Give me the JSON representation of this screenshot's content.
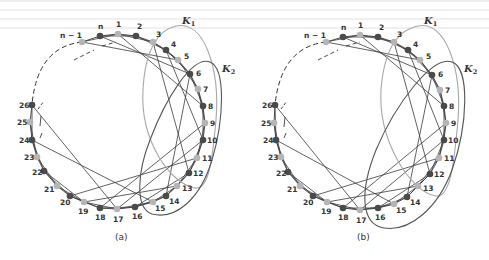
{
  "figure": {
    "colors": {
      "dark_node": "#4a4a4a",
      "light_node": "#b5b5b5",
      "edge": "#3a3a3a",
      "k1_loop": "#a8a8a8",
      "k2_loop": "#555555",
      "dashed": "#333333"
    },
    "panels": [
      {
        "id": "a",
        "caption": "(a)",
        "caption_pos": [
          115,
          240
        ],
        "nodes": [
          {
            "label": "n-1",
            "display": "n − 1",
            "x": 82,
            "y": 42,
            "tone": "light",
            "lx": -22,
            "ly": -4
          },
          {
            "label": "n",
            "display": "n",
            "x": 100,
            "y": 36,
            "tone": "dark",
            "lx": -2,
            "ly": -7
          },
          {
            "label": "1",
            "display": "1",
            "x": 118,
            "y": 34,
            "tone": "light",
            "lx": -2,
            "ly": -7
          },
          {
            "label": "2",
            "display": "2",
            "x": 136,
            "y": 36,
            "tone": "dark",
            "lx": 1,
            "ly": -7
          },
          {
            "label": "3",
            "display": "3",
            "x": 153,
            "y": 42,
            "tone": "light",
            "lx": 3,
            "ly": -5
          },
          {
            "label": "4",
            "display": "4",
            "x": 166,
            "y": 50,
            "tone": "dark",
            "lx": 5,
            "ly": -3
          },
          {
            "label": "5",
            "display": "5",
            "x": 178,
            "y": 60,
            "tone": "light",
            "lx": 6,
            "ly": -1
          },
          {
            "label": "6",
            "display": "6",
            "x": 190,
            "y": 74,
            "tone": "dark",
            "lx": 6,
            "ly": 2
          },
          {
            "label": "7",
            "display": "7",
            "x": 198,
            "y": 89,
            "tone": "light",
            "lx": 5,
            "ly": 3
          },
          {
            "label": "8",
            "display": "8",
            "x": 203,
            "y": 106,
            "tone": "dark",
            "lx": 5,
            "ly": 3
          },
          {
            "label": "9",
            "display": "9",
            "x": 205,
            "y": 123,
            "tone": "light",
            "lx": 5,
            "ly": 3
          },
          {
            "label": "10",
            "display": "10",
            "x": 203,
            "y": 140,
            "tone": "dark",
            "lx": 4,
            "ly": 3
          },
          {
            "label": "11",
            "display": "11",
            "x": 197,
            "y": 158,
            "tone": "light",
            "lx": 5,
            "ly": 3
          },
          {
            "label": "12",
            "display": "12",
            "x": 189,
            "y": 173,
            "tone": "dark",
            "lx": 4,
            "ly": 3
          },
          {
            "label": "13",
            "display": "13",
            "x": 177,
            "y": 186,
            "tone": "light",
            "lx": 5,
            "ly": 5
          },
          {
            "label": "14",
            "display": "14",
            "x": 166,
            "y": 196,
            "tone": "dark",
            "lx": 3,
            "ly": 8
          },
          {
            "label": "15",
            "display": "15",
            "x": 153,
            "y": 202,
            "tone": "light",
            "lx": 2,
            "ly": 9
          },
          {
            "label": "16",
            "display": "16",
            "x": 135,
            "y": 207,
            "tone": "dark",
            "lx": -3,
            "ly": 12
          },
          {
            "label": "17",
            "display": "17",
            "x": 117,
            "y": 209,
            "tone": "light",
            "lx": -4,
            "ly": 13
          },
          {
            "label": "18",
            "display": "18",
            "x": 100,
            "y": 208,
            "tone": "dark",
            "lx": -5,
            "ly": 12
          },
          {
            "label": "19",
            "display": "19",
            "x": 84,
            "y": 202,
            "tone": "light",
            "lx": -6,
            "ly": 12
          },
          {
            "label": "20",
            "display": "20",
            "x": 70,
            "y": 196,
            "tone": "dark",
            "lx": -10,
            "ly": 9
          },
          {
            "label": "21",
            "display": "21",
            "x": 57,
            "y": 186,
            "tone": "light",
            "lx": -13,
            "ly": 6
          },
          {
            "label": "22",
            "display": "22",
            "x": 44,
            "y": 171,
            "tone": "dark",
            "lx": -12,
            "ly": 4
          },
          {
            "label": "23",
            "display": "23",
            "x": 37,
            "y": 157,
            "tone": "light",
            "lx": -13,
            "ly": 3
          },
          {
            "label": "24",
            "display": "24",
            "x": 32,
            "y": 140,
            "tone": "dark",
            "lx": -13,
            "ly": 3
          },
          {
            "label": "25",
            "display": "25",
            "x": 30,
            "y": 122,
            "tone": "light",
            "lx": -13,
            "ly": 3
          },
          {
            "label": "26",
            "display": "26",
            "x": 32,
            "y": 105,
            "tone": "dark",
            "lx": -13,
            "ly": 3
          }
        ],
        "k1": {
          "label": "K",
          "sub": "1",
          "label_pos": [
            182,
            24
          ],
          "path": "M176,26 C205,20 220,70 216,120 C212,165 208,190 195,188 C170,184 140,140 143,90 C145,50 158,30 176,26 Z"
        },
        "k2": {
          "label": "K",
          "sub": "2",
          "label_pos": [
            222,
            72
          ],
          "path": "M210,62 C226,68 224,120 212,160 C200,200 175,220 152,214 C134,208 138,170 150,140 C165,100 192,55 210,62 Z"
        }
      },
      {
        "id": "b",
        "caption": "(b)",
        "caption_pos": [
          357,
          240
        ],
        "nodes": [
          {
            "label": "n-1",
            "display": "n − 1",
            "x": 326,
            "y": 42,
            "tone": "light",
            "lx": -22,
            "ly": -4
          },
          {
            "label": "n",
            "display": "n",
            "x": 343,
            "y": 37,
            "tone": "dark",
            "lx": -2,
            "ly": -7
          },
          {
            "label": "1",
            "display": "1",
            "x": 360,
            "y": 35,
            "tone": "light",
            "lx": -2,
            "ly": -7
          },
          {
            "label": "2",
            "display": "2",
            "x": 378,
            "y": 37,
            "tone": "dark",
            "lx": 1,
            "ly": -7
          },
          {
            "label": "3",
            "display": "3",
            "x": 394,
            "y": 42,
            "tone": "light",
            "lx": 3,
            "ly": -5
          },
          {
            "label": "4",
            "display": "4",
            "x": 408,
            "y": 50,
            "tone": "dark",
            "lx": 5,
            "ly": -3
          },
          {
            "label": "5",
            "display": "5",
            "x": 420,
            "y": 60,
            "tone": "light",
            "lx": 6,
            "ly": -1
          },
          {
            "label": "6",
            "display": "6",
            "x": 432,
            "y": 75,
            "tone": "dark",
            "lx": 6,
            "ly": 2
          },
          {
            "label": "7",
            "display": "7",
            "x": 440,
            "y": 90,
            "tone": "light",
            "lx": 5,
            "ly": 3
          },
          {
            "label": "8",
            "display": "8",
            "x": 444,
            "y": 106,
            "tone": "dark",
            "lx": 5,
            "ly": 3
          },
          {
            "label": "9",
            "display": "9",
            "x": 446,
            "y": 123,
            "tone": "light",
            "lx": 5,
            "ly": 3
          },
          {
            "label": "10",
            "display": "10",
            "x": 444,
            "y": 140,
            "tone": "dark",
            "lx": 4,
            "ly": 3
          },
          {
            "label": "11",
            "display": "11",
            "x": 439,
            "y": 158,
            "tone": "light",
            "lx": 5,
            "ly": 3
          },
          {
            "label": "12",
            "display": "12",
            "x": 430,
            "y": 174,
            "tone": "dark",
            "lx": 4,
            "ly": 3
          },
          {
            "label": "13",
            "display": "13",
            "x": 418,
            "y": 186,
            "tone": "light",
            "lx": 5,
            "ly": 5
          },
          {
            "label": "14",
            "display": "14",
            "x": 407,
            "y": 197,
            "tone": "dark",
            "lx": 3,
            "ly": 8
          },
          {
            "label": "15",
            "display": "15",
            "x": 394,
            "y": 204,
            "tone": "light",
            "lx": 2,
            "ly": 9
          },
          {
            "label": "16",
            "display": "16",
            "x": 378,
            "y": 208,
            "tone": "dark",
            "lx": -3,
            "ly": 12
          },
          {
            "label": "17",
            "display": "17",
            "x": 360,
            "y": 210,
            "tone": "light",
            "lx": -4,
            "ly": 13
          },
          {
            "label": "18",
            "display": "18",
            "x": 343,
            "y": 208,
            "tone": "dark",
            "lx": -5,
            "ly": 12
          },
          {
            "label": "19",
            "display": "19",
            "x": 327,
            "y": 202,
            "tone": "light",
            "lx": -6,
            "ly": 12
          },
          {
            "label": "20",
            "display": "20",
            "x": 313,
            "y": 196,
            "tone": "dark",
            "lx": -10,
            "ly": 9
          },
          {
            "label": "21",
            "display": "21",
            "x": 300,
            "y": 186,
            "tone": "light",
            "lx": -13,
            "ly": 6
          },
          {
            "label": "22",
            "display": "22",
            "x": 288,
            "y": 172,
            "tone": "dark",
            "lx": -12,
            "ly": 4
          },
          {
            "label": "23",
            "display": "23",
            "x": 281,
            "y": 157,
            "tone": "light",
            "lx": -13,
            "ly": 3
          },
          {
            "label": "24",
            "display": "24",
            "x": 276,
            "y": 140,
            "tone": "dark",
            "lx": -13,
            "ly": 3
          },
          {
            "label": "25",
            "display": "25",
            "x": 274,
            "y": 123,
            "tone": "light",
            "lx": -13,
            "ly": 3
          },
          {
            "label": "26",
            "display": "26",
            "x": 275,
            "y": 105,
            "tone": "dark",
            "lx": -13,
            "ly": 3
          }
        ],
        "k1": {
          "label": "K",
          "sub": "1",
          "label_pos": [
            424,
            24
          ],
          "path": "M418,26 C446,20 462,70 458,120 C454,165 450,198 436,196 C410,192 378,140 381,90 C384,50 398,30 418,26 Z"
        },
        "k2": {
          "label": "K",
          "sub": "2",
          "label_pos": [
            464,
            72
          ],
          "path": "M452,62 C470,68 468,125 452,170 C438,208 410,232 384,228 C360,224 360,190 376,150 C395,105 432,55 452,62 Z"
        }
      }
    ]
  }
}
